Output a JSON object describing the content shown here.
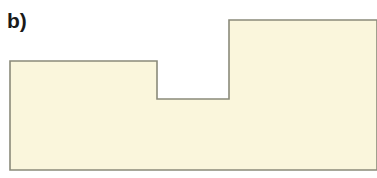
{
  "figure": {
    "panel_label": "b)",
    "label_color": "#1a1a1a",
    "background_color": "#ffffff"
  },
  "shape": {
    "name": "stepped-polygon",
    "fill_color": "#faf6dc",
    "stroke_color": "#8a8a7a",
    "stroke_width": 1.6,
    "description": "Stepped cross-section outline: low-left block, recessed notch, raised right block",
    "vertices": [
      [
        10,
        61
      ],
      [
        157,
        61
      ],
      [
        157,
        99
      ],
      [
        229,
        99
      ],
      [
        229,
        20
      ],
      [
        377,
        20
      ],
      [
        377,
        170
      ],
      [
        10,
        170
      ]
    ],
    "path": "M 10 61 L 157 61 L 157 99 L 229 99 L 229 20 L 377 20 L 377 170 L 10 170 Z"
  },
  "canvas": {
    "width": 377,
    "height": 178
  }
}
